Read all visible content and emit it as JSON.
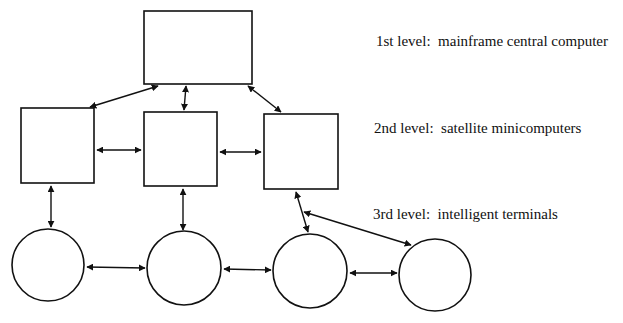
{
  "diagram": {
    "title": "",
    "levels": [
      {
        "label": "1st level:  mainframe central computer",
        "x": 376,
        "y": 33
      },
      {
        "label": "2nd level:  satellite minicomputers",
        "x": 374,
        "y": 120
      },
      {
        "label": "3rd level:  intelligent terminals",
        "x": 373,
        "y": 206
      }
    ],
    "nodes": [
      {
        "id": "mainframe",
        "shape": "rect",
        "level": 1,
        "x": 144,
        "y": 11,
        "w": 108,
        "h": 73
      },
      {
        "id": "mini-left",
        "shape": "rect",
        "level": 2,
        "x": 21,
        "y": 108,
        "w": 73,
        "h": 75
      },
      {
        "id": "mini-center",
        "shape": "rect",
        "level": 2,
        "x": 144,
        "y": 112,
        "w": 73,
        "h": 74
      },
      {
        "id": "mini-right",
        "shape": "rect",
        "level": 2,
        "x": 264,
        "y": 114,
        "w": 74,
        "h": 75
      },
      {
        "id": "terminal-1",
        "shape": "circle",
        "level": 3,
        "cx": 48,
        "cy": 265,
        "r": 36
      },
      {
        "id": "terminal-2",
        "shape": "circle",
        "level": 3,
        "cx": 184,
        "cy": 268,
        "r": 37
      },
      {
        "id": "terminal-3",
        "shape": "circle",
        "level": 3,
        "cx": 310,
        "cy": 271,
        "r": 37
      },
      {
        "id": "terminal-4",
        "shape": "circle",
        "level": 3,
        "cx": 435,
        "cy": 275,
        "r": 36
      }
    ],
    "edges": [
      {
        "from": "mainframe",
        "to": "mini-left",
        "x1": 158,
        "y1": 86,
        "x2": 90,
        "y2": 107
      },
      {
        "from": "mainframe",
        "to": "mini-center",
        "x1": 186,
        "y1": 86,
        "x2": 184,
        "y2": 110
      },
      {
        "from": "mainframe",
        "to": "mini-right",
        "x1": 248,
        "y1": 86,
        "x2": 281,
        "y2": 112
      },
      {
        "from": "mini-left",
        "to": "mini-center",
        "x1": 97,
        "y1": 150,
        "x2": 141,
        "y2": 150
      },
      {
        "from": "mini-center",
        "to": "mini-right",
        "x1": 220,
        "y1": 152,
        "x2": 261,
        "y2": 152
      },
      {
        "from": "mini-left",
        "to": "terminal-1",
        "x1": 51,
        "y1": 186,
        "x2": 51,
        "y2": 227
      },
      {
        "from": "mini-center",
        "to": "terminal-2",
        "x1": 183,
        "y1": 189,
        "x2": 183,
        "y2": 230
      },
      {
        "from": "mini-right",
        "to": "terminal-3",
        "x1": 296,
        "y1": 192,
        "x2": 308,
        "y2": 232
      },
      {
        "from": "mini-right",
        "to": "terminal-4",
        "x1": 304,
        "y1": 212,
        "x2": 411,
        "y2": 245
      },
      {
        "from": "terminal-1",
        "to": "terminal-2",
        "x1": 87,
        "y1": 267,
        "x2": 145,
        "y2": 268
      },
      {
        "from": "terminal-2",
        "to": "terminal-3",
        "x1": 224,
        "y1": 269,
        "x2": 271,
        "y2": 270
      },
      {
        "from": "terminal-3",
        "to": "terminal-4",
        "x1": 350,
        "y1": 273,
        "x2": 397,
        "y2": 273
      }
    ],
    "colors": {
      "stroke": "#111111",
      "background": "#ffffff"
    }
  }
}
